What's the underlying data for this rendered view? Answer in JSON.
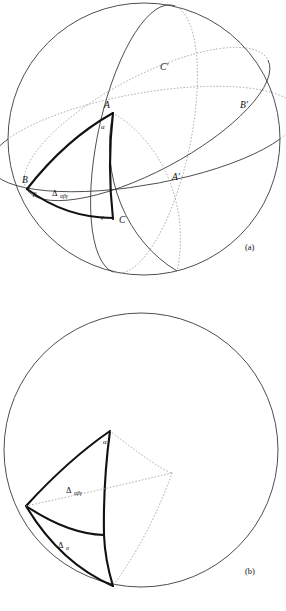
{
  "page": {
    "background_color": "#ffffff",
    "line_color": "#3a3a3a",
    "bold_line_color": "#111111",
    "hidden_line_color": "#9a9a9a"
  },
  "figures": [
    {
      "id": "figure-a",
      "caption": "(a)",
      "sphere": {
        "cx": 144,
        "cy": 139,
        "r": 136
      },
      "vertex_labels": [
        {
          "name": "A",
          "text": "A",
          "x": 104,
          "y": 108
        },
        {
          "name": "B",
          "text": "B",
          "x": 22,
          "y": 183
        },
        {
          "name": "C",
          "text": "C",
          "x": 119,
          "y": 223
        }
      ],
      "angle_labels": [
        {
          "name": "alpha",
          "text": "α",
          "x": 101,
          "y": 129
        },
        {
          "name": "beta",
          "text": "β",
          "x": 33,
          "y": 196
        },
        {
          "name": "gamma",
          "text": "γ",
          "x": 101,
          "y": 219
        }
      ],
      "antipodal_labels": [
        {
          "name": "A-prime",
          "text": "A′",
          "x": 172,
          "y": 180
        },
        {
          "name": "B-prime",
          "text": "B′",
          "x": 240,
          "y": 108
        },
        {
          "name": "C-prime",
          "text": "C′",
          "x": 160,
          "y": 70
        }
      ],
      "region_labels": [
        {
          "name": "triangle-label",
          "delta": "Δ",
          "sub": "αβγ",
          "x": 52,
          "y": 196
        }
      ]
    },
    {
      "id": "figure-b",
      "caption": "(b)",
      "sphere": {
        "cx": 141,
        "cy": 450,
        "r": 137
      },
      "angle_labels": [
        {
          "name": "alpha",
          "text": "α",
          "x": 103,
          "y": 444
        }
      ],
      "region_labels": [
        {
          "name": "triangle-label",
          "delta": "Δ",
          "sub": "αβγ",
          "x": 66,
          "y": 493
        },
        {
          "name": "lune-label",
          "delta": "Δ",
          "sub": "α",
          "x": 58,
          "y": 548
        }
      ]
    }
  ]
}
